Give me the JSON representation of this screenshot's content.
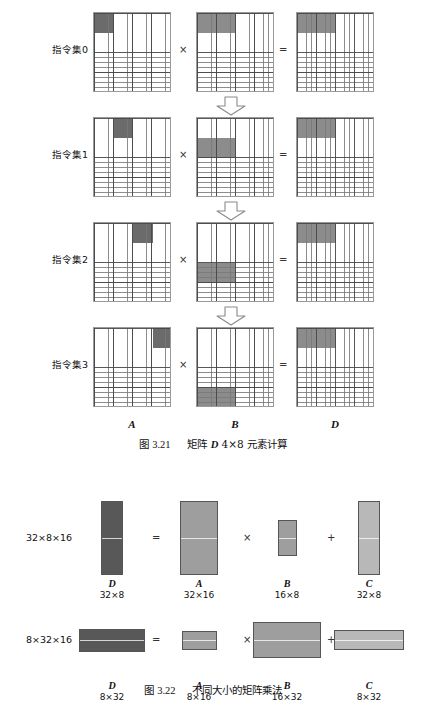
{
  "top_clipped_text": "",
  "colors": {
    "grid_line": "#787878",
    "grid_major": "#464646",
    "block_light": "#b4b4b4",
    "block_mid": "#8c8c8c",
    "block_dark": "#6b6b6b",
    "solid_dark": "#585858",
    "solid_mid": "#9e9e9e",
    "solid_light": "#b8b8b8",
    "outline": "#555555"
  },
  "figure_3_21": {
    "operators": {
      "times": "×",
      "equals": "="
    },
    "matrix_labels": {
      "a": "A",
      "b": "B",
      "d": "D"
    },
    "caption": {
      "prefix": "图",
      "number": "3.21",
      "text_before": "矩阵",
      "symbol": "D",
      "text_after": "4×8 元素计算"
    },
    "rows": [
      {
        "label": "指令集0",
        "a": {
          "x": 0,
          "y": 0,
          "w": 4,
          "h": 4,
          "shade": "block_dark"
        },
        "b": {
          "x": 0,
          "y": 0,
          "w": 8,
          "h": 4,
          "shade": "block_mid"
        },
        "d": {
          "x": 0,
          "y": 0,
          "w": 8,
          "h": 4,
          "shade": "block_mid"
        },
        "arrow_after": true
      },
      {
        "label": "指令集1",
        "a": {
          "x": 4,
          "y": 0,
          "w": 4,
          "h": 4,
          "shade": "block_dark"
        },
        "b": {
          "x": 0,
          "y": 4,
          "w": 8,
          "h": 4,
          "shade": "block_mid"
        },
        "d": {
          "x": 0,
          "y": 0,
          "w": 8,
          "h": 4,
          "shade": "block_mid"
        },
        "arrow_after": true
      },
      {
        "label": "指令集2",
        "a": {
          "x": 8,
          "y": 0,
          "w": 4,
          "h": 4,
          "shade": "block_dark"
        },
        "b": {
          "x": 0,
          "y": 8,
          "w": 8,
          "h": 4,
          "shade": "block_mid"
        },
        "d": {
          "x": 0,
          "y": 0,
          "w": 8,
          "h": 4,
          "shade": "block_mid"
        },
        "arrow_after": true
      },
      {
        "label": "指令集3",
        "a": {
          "x": 12,
          "y": 0,
          "w": 4,
          "h": 4,
          "shade": "block_dark"
        },
        "b": {
          "x": 0,
          "y": 12,
          "w": 8,
          "h": 4,
          "shade": "block_mid"
        },
        "d": {
          "x": 0,
          "y": 0,
          "w": 8,
          "h": 4,
          "shade": "block_mid"
        },
        "arrow_after": false
      }
    ],
    "grid_size": 16
  },
  "figure_3_22": {
    "caption": {
      "prefix": "图",
      "number": "3.22",
      "text": "不同大小的矩阵乘法"
    },
    "operators": {
      "equals": "=",
      "times": "×",
      "plus": "+"
    },
    "rows": [
      {
        "equation": "32×8×16",
        "items": [
          {
            "name": "D",
            "dims": "32×8",
            "shade": "solid_dark",
            "w": 22,
            "h": 74
          },
          {
            "name": "A",
            "dims": "32×16",
            "shade": "solid_mid",
            "w": 38,
            "h": 74
          },
          {
            "name": "B",
            "dims": "16×8",
            "shade": "solid_mid",
            "w": 19,
            "h": 36
          },
          {
            "name": "C",
            "dims": "32×8",
            "shade": "solid_light",
            "w": 22,
            "h": 74
          }
        ]
      },
      {
        "equation": "8×32×16",
        "items": [
          {
            "name": "D",
            "dims": "8×32",
            "shade": "solid_dark",
            "w": 66,
            "h": 23
          },
          {
            "name": "A",
            "dims": "8×16",
            "shade": "solid_mid",
            "w": 35,
            "h": 19
          },
          {
            "name": "B",
            "dims": "16×32",
            "shade": "solid_mid",
            "w": 68,
            "h": 36
          },
          {
            "name": "C",
            "dims": "8×32",
            "shade": "solid_light",
            "w": 70,
            "h": 20
          }
        ]
      }
    ]
  }
}
